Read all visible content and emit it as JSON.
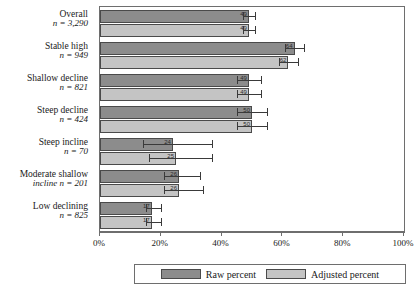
{
  "chart_data": {
    "type": "bar",
    "orientation": "horizontal",
    "title": "",
    "xlabel": "",
    "ylabel": "",
    "xlim": [
      0,
      100
    ],
    "xticks": [
      0,
      20,
      40,
      60,
      80,
      100
    ],
    "xticklabels": [
      "0%",
      "20%",
      "40%",
      "60%",
      "80%",
      "100%"
    ],
    "grid": false,
    "legend_position": "bottom",
    "categories": [
      {
        "label": "Overall",
        "n_text": "n = 3,290",
        "n": 3290
      },
      {
        "label": "Stable high",
        "n_text": "n = 949",
        "n": 949
      },
      {
        "label": "Shallow decline",
        "n_text": "n = 821",
        "n": 821
      },
      {
        "label": "Steep decline",
        "n_text": "n = 424",
        "n": 424
      },
      {
        "label": "Steep incline",
        "n_text": "n = 70",
        "n": 70
      },
      {
        "label": "Moderate shallow",
        "label2": "incline n = 201",
        "n_text": "",
        "n": 201
      },
      {
        "label": "Low declining",
        "n_text": "n = 825",
        "n": 825
      }
    ],
    "series": [
      {
        "name": "Raw percent",
        "color": "#8c8c8c",
        "values": [
          49,
          64,
          49,
          50,
          24,
          26,
          17
        ],
        "value_labels": [
          "49",
          "64",
          "49",
          "50",
          "24",
          "26",
          "17"
        ],
        "err_low": [
          47,
          61,
          45,
          45,
          14,
          21,
          15
        ],
        "err_high": [
          51,
          67,
          53,
          55,
          37,
          33,
          20
        ]
      },
      {
        "name": "Adjusted percent",
        "color": "#c4c4c4",
        "values": [
          49,
          62,
          49,
          50,
          25,
          26,
          17
        ],
        "value_labels": [
          "49",
          "62",
          "49",
          "50",
          "25",
          "26",
          "17"
        ],
        "err_low": [
          47,
          59,
          45,
          45,
          16,
          21,
          15
        ],
        "err_high": [
          51,
          65,
          53,
          55,
          37,
          34,
          20
        ]
      }
    ]
  },
  "legend": {
    "items": [
      {
        "label": "Raw percent",
        "color": "#8c8c8c"
      },
      {
        "label": "Adjusted percent",
        "color": "#c4c4c4"
      }
    ]
  }
}
